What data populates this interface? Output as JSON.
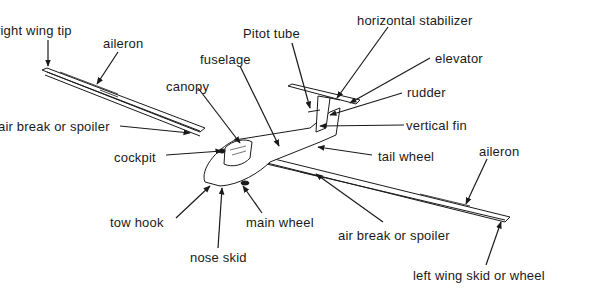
{
  "diagram": {
    "colors": {
      "line": "#1a1a1a",
      "background": "#ffffff"
    },
    "labels": {
      "right_wing_tip": "right wing tip",
      "aileron_right": "aileron",
      "canopy": "canopy",
      "air_break_right": "air break or spoiler",
      "cockpit": "cockpit",
      "fuselage": "fuselage",
      "pitot_tube": "Pitot tube",
      "horizontal_stabilizer": "horizontal stabilizer",
      "elevator": "elevator",
      "rudder": "rudder",
      "vertical_fin": "vertical fin",
      "tail_wheel": "tail wheel",
      "aileron_left": "aileron",
      "tow_hook": "tow hook",
      "main_wheel": "main wheel",
      "nose_skid": "nose skid",
      "air_break_left": "air break or spoiler",
      "left_wing_skid": "left wing skid or wheel"
    }
  }
}
